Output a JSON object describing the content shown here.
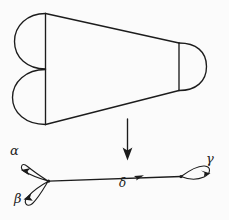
{
  "figure": {
    "background_color": "#fbfbfb",
    "ink_color": "#1c1c1c",
    "caption": "",
    "panels": [
      {
        "name": "upper-panel",
        "description": "tapering band with two semicircular lobes at left and rounded cap at right"
      },
      {
        "name": "lower-panel",
        "description": "graph with two loops at left vertex, directed edge, one loop at right vertex"
      }
    ]
  },
  "upper_shape": {
    "name": "pair-of-pants-band",
    "left_lobe_upper": "semicircle",
    "left_lobe_lower": "semicircle",
    "right_cap": "semicircle",
    "left_boundary": "vertical-segment",
    "right_boundary": "vertical-segment"
  },
  "map_arrow": {
    "name": "deformation-retract-arrow",
    "direction": "down",
    "label": ""
  },
  "graph": {
    "name": "wedge-graph",
    "vertices": [
      {
        "id": "v-left",
        "label": ""
      },
      {
        "id": "v-right",
        "label": ""
      }
    ],
    "edges": [
      {
        "id": "edge-alpha",
        "label": "α",
        "type": "loop",
        "at": "v-left",
        "directed": true
      },
      {
        "id": "edge-beta",
        "label": "β",
        "type": "loop",
        "at": "v-left",
        "directed": true
      },
      {
        "id": "edge-delta",
        "label": "δ",
        "type": "edge",
        "from": "v-left",
        "to": "v-right",
        "directed": true
      },
      {
        "id": "edge-gamma",
        "label": "γ",
        "type": "loop",
        "at": "v-right",
        "directed": true
      }
    ],
    "labels": {
      "alpha": "α",
      "beta": "β",
      "gamma": "γ",
      "delta": "δ"
    }
  }
}
